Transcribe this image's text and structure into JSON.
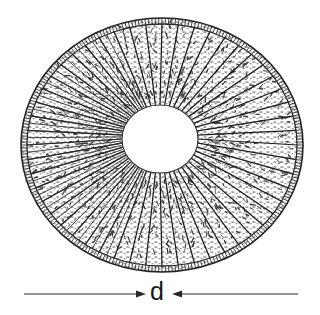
{
  "figure": {
    "kind": "technical-line-drawing",
    "background_color": "#ffffff",
    "ink_color": "#1a1a1a",
    "rim_color": "#2b2b2b",
    "texture_color": "#3a3a3a"
  },
  "disc": {
    "name": "annular-disc",
    "outline_shape": "ellipse",
    "center_x": 162,
    "center_y": 145,
    "radius_x": 141,
    "radius_y": 127,
    "rim_band_thickness": 6,
    "segment_count": 52,
    "segment_fill": "stippled-hatching"
  },
  "hole": {
    "name": "central-hole",
    "shape": "ellipse",
    "center_x": 160,
    "center_y": 139,
    "radius_x": 38,
    "radius_y": 34,
    "fill": "#ffffff"
  },
  "dimension": {
    "label": "d",
    "label_x": 158,
    "label_y": 294,
    "line_y": 294,
    "left_line": {
      "x_start": 24,
      "x_end": 146,
      "arrow_at": "end",
      "arrow_direction": "right"
    },
    "right_line": {
      "x_start": 298,
      "x_end": 172,
      "arrow_at": "end",
      "arrow_direction": "left"
    },
    "measures": "outer diameter of the disc"
  },
  "chart_data": {
    "type": "diagram",
    "title": "",
    "annotations": [
      "d"
    ]
  }
}
